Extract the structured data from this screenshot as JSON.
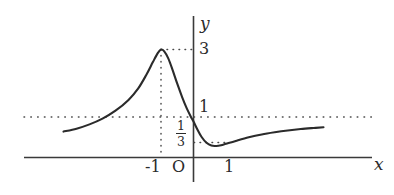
{
  "figure": {
    "axis_labels": {
      "x": "x",
      "y": "y"
    },
    "origin_label": "O",
    "tick_labels": {
      "x_neg1": "-1",
      "x_pos1": "1",
      "y_3": "3",
      "y_1": "1"
    },
    "fraction_label": {
      "numerator": "1",
      "denominator": "3"
    },
    "colors": {
      "curve": "#2b2b2b",
      "axis": "#3a3a3a",
      "dotted": "#4a4a4a",
      "background": "#ffffff"
    }
  },
  "chart_data": {
    "type": "line",
    "title": "",
    "xlabel": "x",
    "ylabel": "y",
    "xlim": [
      -4.0,
      4.2
    ],
    "ylim": [
      -0.2,
      3.6
    ],
    "grid": false,
    "legend": null,
    "annotations": [
      {
        "text": "3",
        "x": 0,
        "y": 3,
        "role": "y-tick-label",
        "note": "local maximum value, dotted leader from peak"
      },
      {
        "text": "1",
        "x": 0,
        "y": 1,
        "role": "y-tick-label",
        "note": "horizontal asymptote y = 1"
      },
      {
        "text": "1/3",
        "x": 0,
        "y": 0.3333,
        "role": "y-tick-label",
        "note": "local minimum value"
      },
      {
        "text": "-1",
        "x": -1,
        "y": 0,
        "role": "x-tick-label",
        "note": "x-coordinate of local maximum"
      },
      {
        "text": "1",
        "x": 1,
        "y": 0,
        "role": "x-tick-label"
      },
      {
        "text": "O",
        "x": 0,
        "y": 0,
        "role": "origin-label"
      }
    ],
    "guides": [
      {
        "kind": "horizontal-dotted",
        "y": 1,
        "x_from": -4.0,
        "x_to": 4.2,
        "label": "1"
      },
      {
        "kind": "horizontal-dotted",
        "y": 3,
        "x_from": -1,
        "x_to": 0,
        "label": "3"
      },
      {
        "kind": "vertical-dotted",
        "x": -1,
        "y_from": 0,
        "y_to": 3,
        "label": "-1"
      },
      {
        "kind": "horizontal-dotted",
        "y": 0.3333,
        "x_from": 0,
        "x_to": 0.55,
        "label": "1/3"
      }
    ],
    "series": [
      {
        "name": "curve",
        "description": "rises from left toward local maximum 3 at x = -1, falls steeply through y = 1 near x = 0, reaches local minimum 1/3 near x = 0.55, then increases asymptotically back toward y = 1",
        "points": [
          [
            -4.0,
            0.72
          ],
          [
            -3.6,
            0.8
          ],
          [
            -3.2,
            0.92
          ],
          [
            -2.8,
            1.08
          ],
          [
            -2.4,
            1.3
          ],
          [
            -2.0,
            1.6
          ],
          [
            -1.7,
            1.92
          ],
          [
            -1.45,
            2.3
          ],
          [
            -1.25,
            2.65
          ],
          [
            -1.1,
            2.9
          ],
          [
            -1.0,
            3.0
          ],
          [
            -0.9,
            2.95
          ],
          [
            -0.78,
            2.76
          ],
          [
            -0.65,
            2.45
          ],
          [
            -0.5,
            2.05
          ],
          [
            -0.35,
            1.68
          ],
          [
            -0.2,
            1.35
          ],
          [
            -0.05,
            1.08
          ],
          [
            0.0,
            1.0
          ],
          [
            0.12,
            0.78
          ],
          [
            0.25,
            0.57
          ],
          [
            0.4,
            0.41
          ],
          [
            0.55,
            0.33
          ],
          [
            0.7,
            0.32
          ],
          [
            0.85,
            0.34
          ],
          [
            1.0,
            0.38
          ],
          [
            1.3,
            0.46
          ],
          [
            1.7,
            0.56
          ],
          [
            2.1,
            0.64
          ],
          [
            2.5,
            0.7
          ],
          [
            2.9,
            0.75
          ],
          [
            3.3,
            0.79
          ],
          [
            3.7,
            0.82
          ],
          [
            4.0,
            0.84
          ]
        ]
      }
    ]
  }
}
